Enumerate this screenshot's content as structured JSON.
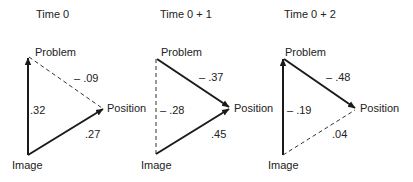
{
  "diagram": {
    "panels": [
      {
        "title": "Time 0",
        "nodes": {
          "problem": "Problem",
          "position": "Position",
          "image": "Image"
        },
        "edges": [
          {
            "from": "Image",
            "to": "Problem",
            "weight": ".32",
            "style": "solid"
          },
          {
            "from": "Problem",
            "to": "Position",
            "weight": "– .09",
            "style": "dashed"
          },
          {
            "from": "Image",
            "to": "Position",
            "weight": ".27",
            "style": "solid"
          }
        ]
      },
      {
        "title": "Time 0 + 1",
        "nodes": {
          "problem": "Problem",
          "position": "Position",
          "image": "Image"
        },
        "edges": [
          {
            "from": "Image",
            "to": "Problem",
            "weight": "– .28",
            "style": "dashed"
          },
          {
            "from": "Problem",
            "to": "Position",
            "weight": "– .37",
            "style": "solid"
          },
          {
            "from": "Image",
            "to": "Position",
            "weight": ".45",
            "style": "solid"
          }
        ]
      },
      {
        "title": "Time 0 + 2",
        "nodes": {
          "problem": "Problem",
          "position": "Position",
          "image": "Image"
        },
        "edges": [
          {
            "from": "Image",
            "to": "Problem",
            "weight": "– .19",
            "style": "solid"
          },
          {
            "from": "Problem",
            "to": "Position",
            "weight": "– .48",
            "style": "solid"
          },
          {
            "from": "Image",
            "to": "Position",
            "weight": ".04",
            "style": "dashed"
          }
        ]
      }
    ]
  }
}
